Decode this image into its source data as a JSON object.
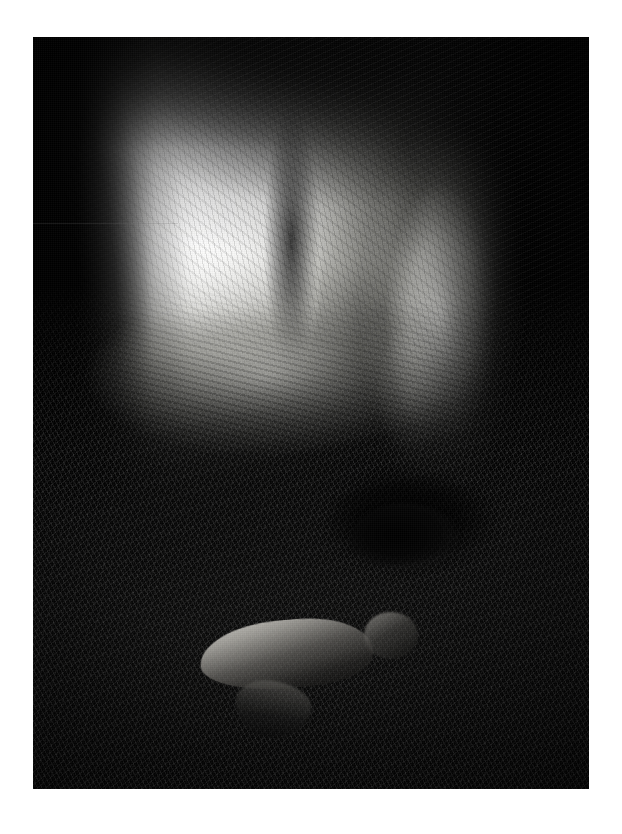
{
  "page": {
    "width": 622,
    "height": 834,
    "background_color": "#ffffff",
    "medium": "black-and-white photograph",
    "border_style": "wide white print margin"
  },
  "photo": {
    "left": 33,
    "top": 37,
    "width": 556,
    "height": 752,
    "orientation": "portrait",
    "palette": {
      "highlight": "#fafaf8",
      "midtone": "#8f8f89",
      "shadow": "#1a1a19",
      "black": "#060606",
      "border": "#ffffff"
    },
    "alt_text": "Black and white photograph looking out from inside a cave: a bright, glowing mouth opens at upper left, a sunlit limestone wall rises at right, and two nude human figures lie on the dark rubble-strewn cave floor in the foreground."
  },
  "scene": {
    "subject": "cave interior with two nude figures",
    "regions": [
      {
        "name": "cave-mouth-glow",
        "label": "Blown-out daylight flooding through the cave opening",
        "center_x_pct": 25.5,
        "center_y_pct": 21
      },
      {
        "name": "cave-vault",
        "label": "Dark overhanging rock ceiling forming the arch"
      },
      {
        "name": "left-rock-jamb",
        "label": "Black silhouetted rock jamb on the left edge"
      },
      {
        "name": "lit-limestone-wall",
        "label": "Brightly lit limestone wall on the right side"
      },
      {
        "name": "right-shadow-mass",
        "label": "Deep black shadow beyond the lit wall"
      },
      {
        "name": "rock-pillar",
        "label": "Narrow rock column splitting the cave opening"
      },
      {
        "name": "rubble-slope",
        "label": "Loose rock and scree slope rising toward the light"
      },
      {
        "name": "foreground-floor",
        "label": "Dark sandy, pitted cave floor in the foreground"
      }
    ],
    "figures": [
      {
        "name": "figure-foreground",
        "label": "Crouching nude figure, back toward camera, head lowered to the right",
        "position": "lower centre",
        "left_pct": 30,
        "top_pct": 76.5,
        "width_pct": 40,
        "height_pct": 13,
        "tone": "lit highlight along the back, body falling into shadow"
      },
      {
        "name": "figure-background",
        "label": "Second figure lying in a dark hollow in the rubble",
        "position": "middle right",
        "left_pct": 57,
        "top_pct": 62,
        "width_pct": 20,
        "height_pct": 9,
        "tone": "almost entirely in silhouette"
      }
    ],
    "lighting": {
      "source": "daylight entering the cave mouth",
      "direction": "from upper left",
      "contrast": "very high, deep blacks with blown highlights"
    }
  }
}
